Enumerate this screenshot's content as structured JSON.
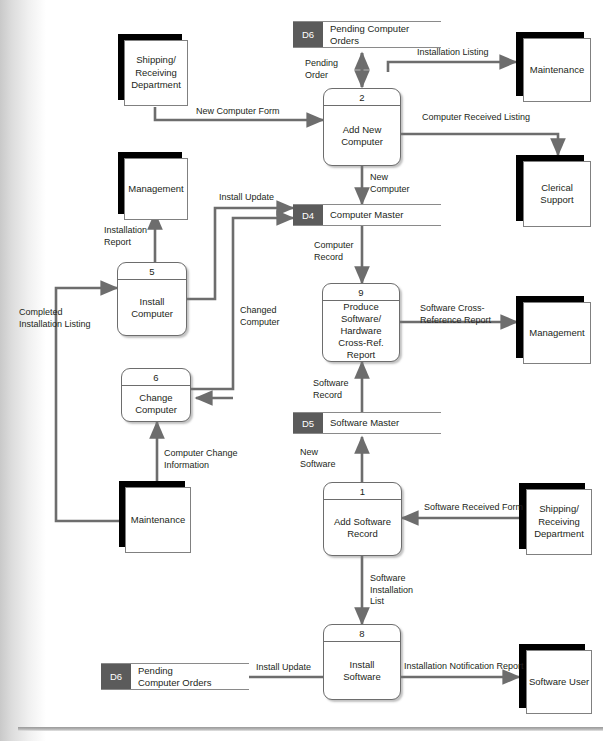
{
  "diagram": {
    "type": "data-flow-diagram",
    "colors": {
      "store_id_fill": "#5b5b5b",
      "entity_shadow": "#000000",
      "line": "#6d6d6d",
      "text": "#231f20",
      "page_background": "#ffffff"
    }
  },
  "entities": [
    {
      "id": "e-shipping-top",
      "label": "Shipping/\nReceiving\nDepartment"
    },
    {
      "id": "e-maintenance-right",
      "label": "Maintenance"
    },
    {
      "id": "e-clerical-support",
      "label": "Clerical\nSupport"
    },
    {
      "id": "e-management-left",
      "label": "Management"
    },
    {
      "id": "e-management-right",
      "label": "Management"
    },
    {
      "id": "e-maintenance-left",
      "label": "Maintenance"
    },
    {
      "id": "e-shipping-bottom",
      "label": "Shipping/\nReceiving\nDepartment"
    },
    {
      "id": "e-software-user",
      "label": "Software\nUser"
    }
  ],
  "processes": [
    {
      "id": "p2",
      "number": "2",
      "label": "Add New\nComputer"
    },
    {
      "id": "p5",
      "number": "5",
      "label": "Install\nComputer"
    },
    {
      "id": "p9",
      "number": "9",
      "label": "Produce\nSoftware/\nHardware\nCross-Ref.\nReport"
    },
    {
      "id": "p6",
      "number": "6",
      "label": "Change\nComputer"
    },
    {
      "id": "p1",
      "number": "1",
      "label": "Add Software\nRecord"
    },
    {
      "id": "p8",
      "number": "8",
      "label": "Install\nSoftware"
    }
  ],
  "datastores": [
    {
      "id": "d6-top",
      "code": "D6",
      "name": "Pending Computer\nOrders"
    },
    {
      "id": "d4",
      "code": "D4",
      "name": "Computer Master"
    },
    {
      "id": "d5",
      "code": "D5",
      "name": "Software Master"
    },
    {
      "id": "d6-bottom",
      "code": "D6",
      "name": "Pending\nComputer Orders"
    }
  ],
  "flows": [
    {
      "id": "f-pending-order",
      "label": "Pending\nOrder"
    },
    {
      "id": "f-installation-listing",
      "label": "Installation Listing"
    },
    {
      "id": "f-new-computer-form",
      "label": "New Computer Form"
    },
    {
      "id": "f-computer-received-listing",
      "label": "Computer Received Listing"
    },
    {
      "id": "f-new-computer",
      "label": "New\nComputer"
    },
    {
      "id": "f-install-update-top",
      "label": "Install Update"
    },
    {
      "id": "f-installation-report",
      "label": "Installation\nReport"
    },
    {
      "id": "f-computer-record",
      "label": "Computer\nRecord"
    },
    {
      "id": "f-changed-computer",
      "label": "Changed\nComputer"
    },
    {
      "id": "f-completed-installation-listing",
      "label": "Completed\nInstallation Listing"
    },
    {
      "id": "f-software-cross-reference-report",
      "label": "Software Cross-\nReference Report"
    },
    {
      "id": "f-software-record",
      "label": "Software\nRecord"
    },
    {
      "id": "f-computer-change-information",
      "label": "Computer Change\nInformation"
    },
    {
      "id": "f-new-software",
      "label": "New\nSoftware"
    },
    {
      "id": "f-software-received-form",
      "label": "Software Received Form"
    },
    {
      "id": "f-software-installation-list",
      "label": "Software\nInstallation\nList"
    },
    {
      "id": "f-install-update-bottom",
      "label": "Install Update"
    },
    {
      "id": "f-installation-notification-report",
      "label": "Installation Notification Report"
    }
  ]
}
